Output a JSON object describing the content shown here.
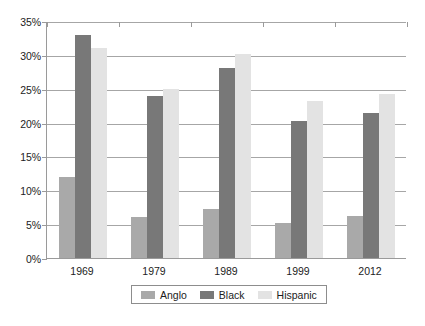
{
  "chart_data": {
    "type": "bar",
    "title": "",
    "subtitle": "",
    "xlabel": "",
    "ylabel": "",
    "categories": [
      "1969",
      "1979",
      "1989",
      "1999",
      "2012"
    ],
    "series": [
      {
        "name": "Anglo",
        "color": "#a9a9a9",
        "values": [
          12.0,
          6.0,
          7.2,
          5.2,
          6.2
        ]
      },
      {
        "name": "Black",
        "color": "#787878",
        "values": [
          33.0,
          24.0,
          28.0,
          20.2,
          21.4
        ]
      },
      {
        "name": "Hispanic",
        "color": "#e3e3e3",
        "values": [
          31.0,
          25.0,
          30.2,
          23.2,
          24.2
        ]
      }
    ],
    "ylim": [
      0,
      35
    ],
    "ytick_values": [
      0,
      5,
      10,
      15,
      20,
      25,
      30,
      35
    ],
    "ytick_labels": [
      "0%",
      "5%",
      "10%",
      "15%",
      "20%",
      "25%",
      "30%",
      "35%"
    ],
    "grid": true,
    "legend_position": "bottom",
    "unit": "%"
  },
  "legend": {
    "items": [
      {
        "label": "Anglo"
      },
      {
        "label": "Black"
      },
      {
        "label": "Hispanic"
      }
    ]
  },
  "caption": {
    "text": ""
  }
}
